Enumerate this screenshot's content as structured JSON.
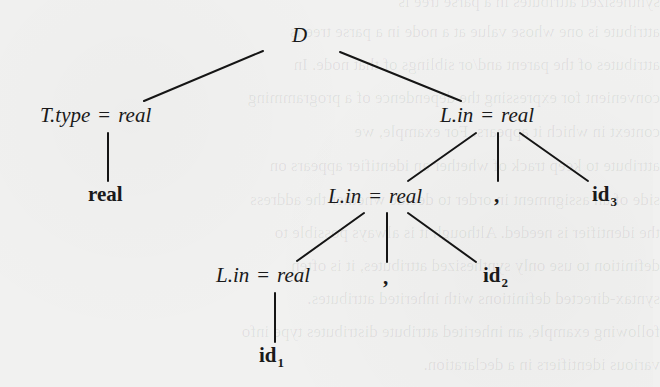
{
  "figure": {
    "type": "annotated-parse-tree",
    "root": {
      "label": "D"
    },
    "nodes": {
      "ttype": {
        "attr": "T.type",
        "eq": "=",
        "value": "real"
      },
      "real_token": {
        "label": "real"
      },
      "lin_top": {
        "attr": "L.in",
        "eq": "=",
        "value": "real"
      },
      "lin_mid": {
        "attr": "L.in",
        "eq": "=",
        "value": "real"
      },
      "comma_top": {
        "label": ","
      },
      "id3": {
        "base": "id",
        "sub": "3"
      },
      "lin_bot": {
        "attr": "L.in",
        "eq": "=",
        "value": "real"
      },
      "comma_mid": {
        "label": ","
      },
      "id2": {
        "base": "id",
        "sub": "2"
      },
      "id1": {
        "base": "id",
        "sub": "1"
      }
    },
    "edges": [
      {
        "from": "D",
        "to": "T.type = real",
        "x1": 263,
        "y1": 51,
        "x2": 144,
        "y2": 101
      },
      {
        "from": "D",
        "to": "L.in = real (top)",
        "x1": 340,
        "y1": 52,
        "x2": 461,
        "y2": 101
      },
      {
        "from": "T.type = real",
        "to": "real",
        "x1": 108,
        "y1": 133,
        "x2": 108,
        "y2": 181
      },
      {
        "from": "L.in = real (top)",
        "to": "L.in = real (mid)",
        "x1": 476,
        "y1": 133,
        "x2": 408,
        "y2": 181
      },
      {
        "from": "L.in = real (top)",
        "to": ",",
        "x1": 498,
        "y1": 133,
        "x2": 498,
        "y2": 181
      },
      {
        "from": "L.in = real (top)",
        "to": "id3",
        "x1": 520,
        "y1": 133,
        "x2": 588,
        "y2": 181
      },
      {
        "from": "L.in = real (mid)",
        "to": "L.in = real (bot)",
        "x1": 364,
        "y1": 213,
        "x2": 297,
        "y2": 261
      },
      {
        "from": "L.in = real (mid)",
        "to": ",",
        "x1": 387,
        "y1": 213,
        "x2": 387,
        "y2": 262
      },
      {
        "from": "L.in = real (mid)",
        "to": "id2",
        "x1": 408,
        "y1": 213,
        "x2": 476,
        "y2": 262
      },
      {
        "from": "L.in = real (bot)",
        "to": "id1",
        "x1": 275,
        "y1": 293,
        "x2": 275,
        "y2": 342
      }
    ]
  },
  "ghost_text": [
    "synthesized attributes in a parse tree is",
    "attribute is one whose value at a node in a parse tree is",
    "attributes of the parent and/or siblings of that node. In",
    "convenient for expressing the dependence of a programming",
    "context in which it appears. For example, we",
    "attribute to keep track of whether an identifier appears on",
    "side of an assignment in order to decide whether the address",
    "the identifier is needed. Although it is always possible to",
    "definition to use only synthesized attributes, it is often",
    "syntax-directed definitions with inherited attributes.",
    "following example, an inherited attribute distributes type info",
    "various identifiers in a declaration."
  ]
}
